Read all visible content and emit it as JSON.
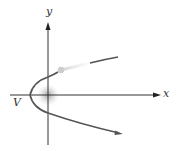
{
  "diagram": {
    "type": "parabola-horizontal",
    "axes": {
      "x_label": "x",
      "y_label": "y",
      "origin": [
        48,
        95
      ],
      "x_axis": {
        "from": 10,
        "to": 160
      },
      "y_axis": {
        "from": 145,
        "to": 22
      }
    },
    "vertex_label": "V",
    "vertex": [
      30,
      95
    ],
    "colors": {
      "curve": "#555555",
      "axis": "#333333",
      "glow": "#bbbbbb",
      "dot": "#cccccc",
      "background": "#ffffff"
    }
  }
}
